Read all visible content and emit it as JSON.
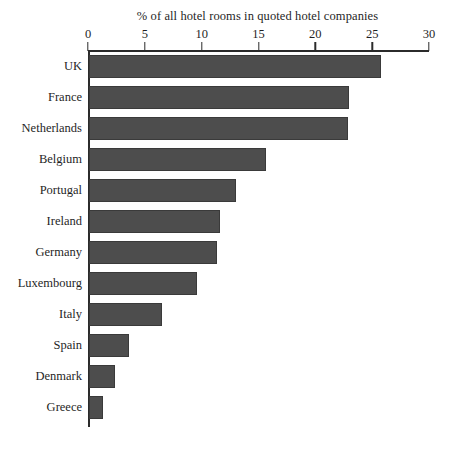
{
  "chart_data": {
    "type": "bar",
    "orientation": "horizontal",
    "title": "% of all hotel rooms in quoted hotel companies",
    "xlabel": "",
    "ylabel": "",
    "xlim": [
      0,
      30
    ],
    "xticks": [
      0,
      5,
      10,
      15,
      20,
      25,
      30
    ],
    "xtick_labels": [
      "0",
      "5",
      "10",
      "15",
      "20",
      "25",
      "30"
    ],
    "grid": false,
    "legend": false,
    "bar_color": "#4d4d4d",
    "categories": [
      "UK",
      "France",
      "Netherlands",
      "Belgium",
      "Portugal",
      "Ireland",
      "Germany",
      "Luxembourg",
      "Italy",
      "Spain",
      "Denmark",
      "Greece"
    ],
    "values": [
      25.7,
      22.9,
      22.8,
      15.6,
      12.9,
      11.5,
      11.3,
      9.5,
      6.4,
      3.5,
      2.3,
      1.2
    ]
  }
}
